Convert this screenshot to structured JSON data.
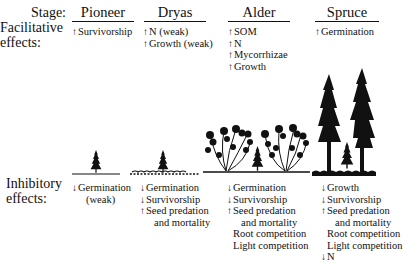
{
  "row_labels": {
    "stage": "Stage:",
    "facilitative_line1": "Facilitative",
    "facilitative_line2": "effects:",
    "inhibitory_line1": "Inhibitory",
    "inhibitory_line2": "effects:"
  },
  "arrows": {
    "up": "↑",
    "down": "↓"
  },
  "stages": [
    {
      "name": "Pioneer",
      "facilitative": [
        {
          "dir": "up",
          "text": "Survivorship"
        }
      ],
      "inhibitory": [
        {
          "dir": "down",
          "text": "Germination"
        },
        {
          "dir": "none",
          "text": "(weak)"
        }
      ],
      "illustration": "single small spruce seedling on bare ground"
    },
    {
      "name": "Dryas",
      "facilitative": [
        {
          "dir": "up",
          "text": "N (weak)"
        },
        {
          "dir": "up",
          "text": "Growth (weak)"
        }
      ],
      "inhibitory": [
        {
          "dir": "down",
          "text": "Germination"
        },
        {
          "dir": "down",
          "text": "Survivorship"
        },
        {
          "dir": "up",
          "text": "Seed predation"
        },
        {
          "dir": "none",
          "text": "and mortality"
        }
      ],
      "illustration": "small spruce seedling in low Dryas mat"
    },
    {
      "name": "Alder",
      "facilitative": [
        {
          "dir": "up",
          "text": "SOM"
        },
        {
          "dir": "up",
          "text": "N"
        },
        {
          "dir": "up",
          "text": "Mycorrhizae"
        },
        {
          "dir": "up",
          "text": "Growth"
        }
      ],
      "inhibitory": [
        {
          "dir": "down",
          "text": "Germination"
        },
        {
          "dir": "down",
          "text": "Survivorship"
        },
        {
          "dir": "up",
          "text": "Seed predation"
        },
        {
          "dir": "none",
          "text": "and mortality"
        },
        {
          "dir": "none",
          "text": "Root competition"
        },
        {
          "dir": "none",
          "text": "Light competition"
        }
      ],
      "illustration": "spruce seedling between alder shrubs"
    },
    {
      "name": "Spruce",
      "facilitative": [
        {
          "dir": "up",
          "text": "Germination"
        }
      ],
      "inhibitory": [
        {
          "dir": "down",
          "text": "Growth"
        },
        {
          "dir": "down",
          "text": "Survivorship"
        },
        {
          "dir": "up",
          "text": "Seed predation"
        },
        {
          "dir": "none",
          "text": "and mortality"
        },
        {
          "dir": "none",
          "text": "Root competition"
        },
        {
          "dir": "none",
          "text": "Light competition"
        },
        {
          "dir": "down",
          "text": "N"
        }
      ],
      "illustration": "small spruce between two tall mature spruce trees"
    }
  ],
  "labels": {
    "s0": "Pioneer",
    "s1": "Dryas",
    "s2": "Alder",
    "s3": "Spruce",
    "p_f0": "Survivorship",
    "d_f0": "N (weak)",
    "d_f1": "Growth (weak)",
    "a_f0": "SOM",
    "a_f1": "N",
    "a_f2": "Mycorrhizae",
    "a_f3": "Growth",
    "sp_f0": "Germination",
    "p_i0": "Germination",
    "p_i1": "(weak)",
    "d_i0": "Germination",
    "d_i1": "Survivorship",
    "d_i2": "Seed predation",
    "d_i3": "and mortality",
    "a_i0": "Germination",
    "a_i1": "Survivorship",
    "a_i2": "Seed predation",
    "a_i3": "and mortality",
    "a_i4": "Root competition",
    "a_i5": "Light competition",
    "sp_i0": "Growth",
    "sp_i1": "Survivorship",
    "sp_i2": "Seed predation",
    "sp_i3": "and mortality",
    "sp_i4": "Root competition",
    "sp_i5": "Light competition",
    "sp_i6": "N"
  }
}
